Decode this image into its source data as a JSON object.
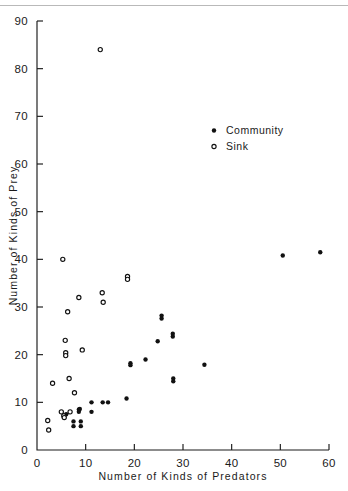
{
  "figure": {
    "background_color": "#ffffff",
    "ink_color": "#111111"
  },
  "chart_data": {
    "type": "scatter",
    "title": "",
    "xlabel": "Number of Kinds of Predators",
    "ylabel": "Number of Kinds of Prey",
    "xlim": [
      0,
      60
    ],
    "ylim": [
      0,
      90
    ],
    "xticks": [
      0,
      10,
      20,
      30,
      40,
      50,
      60
    ],
    "xtick_labels": [
      "0",
      "10",
      "20",
      "30",
      "40",
      "50",
      "60"
    ],
    "yticks": [
      0,
      10,
      20,
      30,
      40,
      50,
      60,
      70,
      80,
      90
    ],
    "ytick_labels": [
      "0",
      "10",
      "20",
      "30",
      "40",
      "50",
      "60",
      "70",
      "80",
      "90"
    ],
    "grid": false,
    "legend_position": "upper center",
    "series": [
      {
        "name": "Community",
        "marker": "filled-circle",
        "color": "#111111",
        "points": [
          [
            6.0,
            7.5
          ],
          [
            7.5,
            6.0
          ],
          [
            7.5,
            5.0
          ],
          [
            8.6,
            8.5
          ],
          [
            8.6,
            8.0
          ],
          [
            8.8,
            8.6
          ],
          [
            9.0,
            6.0
          ],
          [
            9.0,
            5.0
          ],
          [
            11.2,
            10.0
          ],
          [
            11.2,
            8.0
          ],
          [
            13.5,
            10.0
          ],
          [
            14.6,
            10.0
          ],
          [
            18.4,
            10.8
          ],
          [
            19.2,
            18.2
          ],
          [
            19.2,
            17.8
          ],
          [
            22.3,
            19.0
          ],
          [
            24.8,
            22.8
          ],
          [
            25.6,
            28.2
          ],
          [
            25.6,
            27.6
          ],
          [
            27.9,
            24.4
          ],
          [
            27.9,
            23.8
          ],
          [
            28.0,
            15.0
          ],
          [
            28.0,
            14.4
          ],
          [
            34.4,
            17.9
          ],
          [
            50.5,
            40.8
          ],
          [
            58.2,
            41.5
          ]
        ]
      },
      {
        "name": "Sink",
        "marker": "open-circle",
        "color": "#111111",
        "points": [
          [
            2.2,
            6.2
          ],
          [
            2.4,
            4.2
          ],
          [
            3.2,
            14.0
          ],
          [
            5.0,
            8.0
          ],
          [
            5.3,
            40.0
          ],
          [
            5.5,
            7.2
          ],
          [
            5.6,
            6.8
          ],
          [
            5.8,
            23.0
          ],
          [
            5.9,
            20.4
          ],
          [
            5.9,
            19.8
          ],
          [
            6.3,
            29.0
          ],
          [
            6.6,
            15.0
          ],
          [
            6.8,
            8.0
          ],
          [
            7.7,
            12.0
          ],
          [
            8.6,
            32.0
          ],
          [
            9.3,
            21.0
          ],
          [
            13.0,
            84.0
          ],
          [
            13.4,
            33.0
          ],
          [
            13.6,
            31.0
          ],
          [
            18.6,
            36.4
          ],
          [
            18.6,
            35.8
          ]
        ]
      }
    ],
    "legend": [
      {
        "label": "Community",
        "marker": "filled-circle"
      },
      {
        "label": "Sink",
        "marker": "open-circle"
      }
    ]
  }
}
